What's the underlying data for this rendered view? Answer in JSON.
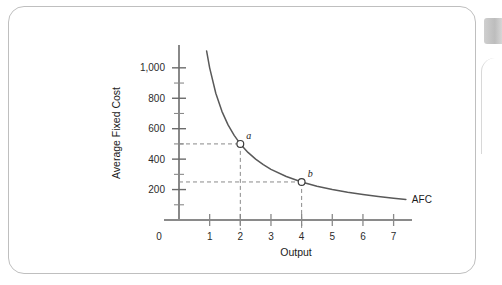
{
  "figure": {
    "frame_color": "#bfbfbf",
    "background": "#ffffff"
  },
  "page_decor": {
    "tab_color": "#c9c9c9",
    "tab_name": "page-edge-tab"
  },
  "chart_data": {
    "type": "line",
    "title": "",
    "xlabel": "Output",
    "ylabel": "Average Fixed Cost",
    "xlim": [
      0,
      7.6
    ],
    "ylim": [
      0,
      1150
    ],
    "grid": false,
    "legend": "none",
    "x_ticks": [
      0,
      1,
      2,
      3,
      4,
      5,
      6,
      7
    ],
    "x_tick_labels": [
      "0",
      "1",
      "2",
      "3",
      "4",
      "5",
      "6",
      "7"
    ],
    "y_ticks": [
      200,
      400,
      600,
      800,
      1000
    ],
    "y_tick_labels": [
      "200",
      "400",
      "600",
      "800",
      "1,000"
    ],
    "y_minor_ticks": [
      100,
      300,
      500,
      700,
      900
    ],
    "series": [
      {
        "name": "AFC",
        "label": "AFC",
        "color": "#595959",
        "formula": "AFC = 1000 / Q",
        "x": [
          0.9,
          1.0,
          1.2,
          1.4,
          1.6,
          1.8,
          2.0,
          2.25,
          2.5,
          2.75,
          3.0,
          3.5,
          4.0,
          4.5,
          5.0,
          5.5,
          6.0,
          6.5,
          7.0,
          7.4
        ],
        "y": [
          1111,
          1000,
          833,
          714,
          625,
          556,
          500,
          444,
          400,
          364,
          333,
          286,
          250,
          222,
          200,
          182,
          167,
          154,
          143,
          135
        ]
      }
    ],
    "annotations": [
      {
        "name": "point-a",
        "label": "a",
        "x": 2,
        "y": 500,
        "marker": "open-circle",
        "guides": [
          "horizontal",
          "vertical"
        ]
      },
      {
        "name": "point-b",
        "label": "b",
        "x": 4,
        "y": 250,
        "marker": "open-circle",
        "guides": [
          "horizontal",
          "vertical"
        ]
      }
    ],
    "guide_style": {
      "color": "#8a8a8a",
      "dash": "4,3"
    }
  }
}
